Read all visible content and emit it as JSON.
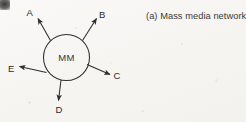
{
  "figure": {
    "caption": "(a) Mass media network",
    "hub": {
      "id": "MM",
      "label": "MM",
      "name": "mass-media-hub",
      "cx": 66.5,
      "cy": 57.5,
      "r": 23
    },
    "stroke_color": "#2f2f2d",
    "background_color": "#f7f6f4",
    "text_color": "#2b2b2b",
    "receivers": [
      {
        "id": "A",
        "label": "A",
        "name": "receiver-a",
        "line": {
          "x1": 50.5,
          "y1": 40.5,
          "x2": 38.0,
          "y2": 18.5
        },
        "label_x": 26.5,
        "label_y": 16.0
      },
      {
        "id": "B",
        "label": "B",
        "name": "receiver-b",
        "line": {
          "x1": 82.5,
          "y1": 40.5,
          "x2": 96.5,
          "y2": 18.5
        },
        "label_x": 99.0,
        "label_y": 17.5
      },
      {
        "id": "C",
        "label": "C",
        "name": "receiver-c",
        "line": {
          "x1": 87.0,
          "y1": 64.5,
          "x2": 110.0,
          "y2": 74.5
        },
        "label_x": 113.5,
        "label_y": 79.0
      },
      {
        "id": "D",
        "label": "D",
        "name": "receiver-d",
        "line": {
          "x1": 61.0,
          "y1": 80.0,
          "x2": 58.5,
          "y2": 100.5
        },
        "label_x": 55.5,
        "label_y": 113.0
      },
      {
        "id": "E",
        "label": "E",
        "name": "receiver-e",
        "line": {
          "x1": 46.5,
          "y1": 72.5,
          "x2": 19.5,
          "y2": 66.5
        },
        "label_x": 8.0,
        "label_y": 72.0
      }
    ]
  }
}
